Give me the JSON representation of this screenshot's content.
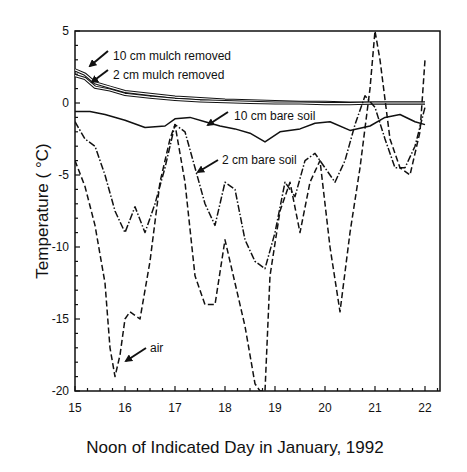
{
  "chart_data": {
    "type": "line",
    "title": "",
    "xlabel": "Noon of Indicated Day in January, 1992",
    "ylabel": "Temperature (°C)",
    "xlim": [
      15,
      22.3
    ],
    "ylim": [
      -20,
      5
    ],
    "xticks": [
      15,
      16,
      17,
      18,
      19,
      20,
      21,
      22
    ],
    "yticks": [
      5,
      0,
      -5,
      -10,
      -15,
      -20
    ],
    "grid": false,
    "legend": "inline annotations with arrows",
    "series": [
      {
        "name": "10 cm mulch removed",
        "style": "solid-double",
        "x": [
          15.0,
          15.2,
          15.4,
          15.7,
          16.0,
          16.5,
          17.0,
          17.5,
          18.0,
          18.5,
          19.0,
          19.5,
          20.0,
          20.5,
          21.0,
          21.5,
          22.0
        ],
        "y": [
          2.3,
          2.0,
          1.4,
          1.1,
          0.8,
          0.6,
          0.4,
          0.3,
          0.2,
          0.15,
          0.1,
          0.05,
          0.05,
          0.0,
          0.0,
          0.0,
          0.0
        ]
      },
      {
        "name": "2 cm mulch removed",
        "style": "solid-double",
        "x": [
          15.0,
          15.2,
          15.4,
          15.7,
          16.0,
          16.5,
          17.0,
          17.5,
          18.0,
          18.5,
          19.0,
          19.5,
          20.0,
          20.5,
          21.0,
          21.5,
          22.0
        ],
        "y": [
          1.9,
          1.7,
          1.1,
          0.9,
          0.6,
          0.4,
          0.25,
          0.15,
          0.1,
          0.05,
          0.0,
          0.0,
          -0.05,
          -0.05,
          0.0,
          0.0,
          0.0
        ]
      },
      {
        "name": "10 cm bare soil",
        "style": "solid",
        "x": [
          15.0,
          15.3,
          15.6,
          16.0,
          16.4,
          16.8,
          17.0,
          17.3,
          17.6,
          17.9,
          18.2,
          18.5,
          18.8,
          19.1,
          19.5,
          19.8,
          20.1,
          20.5,
          20.9,
          21.2,
          21.5,
          21.8,
          22.0
        ],
        "y": [
          -0.6,
          -0.6,
          -0.8,
          -1.2,
          -1.7,
          -1.6,
          -1.1,
          -1.0,
          -1.3,
          -1.6,
          -1.8,
          -2.1,
          -2.7,
          -2.0,
          -1.8,
          -1.4,
          -1.3,
          -1.9,
          -1.6,
          -1.0,
          -0.8,
          -1.3,
          -1.5
        ]
      },
      {
        "name": "2 cm bare soil",
        "style": "dash-dot",
        "x": [
          15.0,
          15.2,
          15.4,
          15.6,
          15.8,
          16.0,
          16.2,
          16.4,
          16.6,
          16.8,
          17.0,
          17.2,
          17.4,
          17.6,
          17.8,
          18.0,
          18.2,
          18.4,
          18.6,
          18.8,
          19.0,
          19.2,
          19.4,
          19.6,
          19.8,
          20.0,
          20.2,
          20.4,
          20.6,
          20.8,
          21.0,
          21.2,
          21.4,
          21.6,
          21.8,
          22.0
        ],
        "y": [
          -1.3,
          -2.5,
          -3.0,
          -5.0,
          -7.5,
          -9.0,
          -7.2,
          -9.0,
          -7.0,
          -4.5,
          -1.5,
          -2.0,
          -4.5,
          -7.0,
          -8.5,
          -5.5,
          -6.0,
          -9.5,
          -11.0,
          -11.5,
          -9.0,
          -5.5,
          -6.5,
          -4.0,
          -3.5,
          -4.5,
          -5.5,
          -4.0,
          -1.5,
          0.5,
          -0.3,
          -2.5,
          -4.5,
          -4.5,
          -3.0,
          -0.3
        ]
      },
      {
        "name": "air",
        "style": "dashed",
        "x": [
          15.0,
          15.2,
          15.4,
          15.6,
          15.7,
          15.8,
          15.9,
          16.0,
          16.1,
          16.3,
          16.5,
          16.7,
          16.9,
          17.0,
          17.2,
          17.4,
          17.6,
          17.8,
          18.0,
          18.2,
          18.4,
          18.6,
          18.7,
          18.8,
          18.9,
          19.1,
          19.3,
          19.5,
          19.7,
          19.9,
          20.1,
          20.3,
          20.5,
          20.7,
          20.9,
          21.0,
          21.1,
          21.3,
          21.5,
          21.7,
          21.9,
          22.0
        ],
        "y": [
          -4.0,
          -5.8,
          -8.5,
          -12.5,
          -17.0,
          -19.0,
          -17.5,
          -15.0,
          -14.5,
          -15.0,
          -11.0,
          -5.5,
          -2.5,
          -1.5,
          -5.5,
          -12.0,
          -14.0,
          -14.0,
          -9.5,
          -12.5,
          -15.5,
          -19.5,
          -20.0,
          -20.0,
          -12.0,
          -7.5,
          -5.5,
          -9.0,
          -5.5,
          -4.0,
          -10.0,
          -14.5,
          -9.0,
          -4.5,
          1.0,
          5.0,
          3.0,
          -2.5,
          -4.5,
          -5.0,
          -2.0,
          3.0
        ]
      }
    ],
    "annotations": [
      {
        "text": "10 cm mulch removed",
        "arrow_to": [
          15.4,
          1.5
        ]
      },
      {
        "text": "2 cm mulch removed",
        "arrow_to": [
          15.3,
          1.1
        ]
      },
      {
        "text": "10 cm bare soil",
        "arrow_to": [
          17.6,
          -1.3
        ]
      },
      {
        "text": "2 cm bare soil",
        "arrow_to": [
          17.2,
          -4.6
        ]
      },
      {
        "text": "air",
        "arrow_to": [
          15.9,
          -17.6
        ]
      }
    ]
  },
  "labels": {
    "xlabel": "Noon of Indicated Day in January, 1992",
    "ylabel": "Temperature ( °C)",
    "ann_10cm_mulch": "10 cm mulch removed",
    "ann_2cm_mulch": "2 cm mulch removed",
    "ann_10cm_bare": "10 cm bare soil",
    "ann_2cm_bare": "2 cm bare soil",
    "ann_air": "air",
    "xtick": [
      "15",
      "16",
      "17",
      "18",
      "19",
      "20",
      "21",
      "22"
    ],
    "ytick": [
      "5",
      "0",
      "-5",
      "-10",
      "-15",
      "-20"
    ]
  }
}
